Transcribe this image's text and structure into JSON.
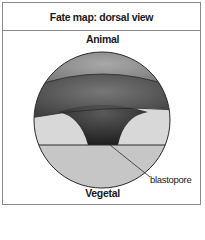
{
  "figure": {
    "title": "Fate map: dorsal view",
    "labels": {
      "top": "Animal",
      "bottom": "Vegetal",
      "pointer": "blastopore"
    },
    "colors": {
      "frame": "#8a8a8a",
      "outline": "#2a2a2a",
      "animal_cap": "#8c8c8c",
      "marginal_band": "#5a5a5a",
      "blastopore_funnel": "#3a3a3a",
      "lateral_regions": "#d6d6d6",
      "vegetal_region": "#c4c4c4"
    }
  }
}
